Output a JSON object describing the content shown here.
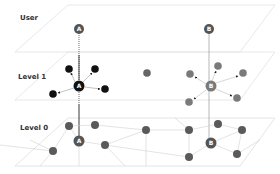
{
  "levels": [
    {
      "id": "user",
      "label": "User"
    },
    {
      "id": "level1",
      "label": "Level 1"
    },
    {
      "id": "level0",
      "label": "Level 0"
    }
  ],
  "nodes": {
    "user_a": {
      "letter": "A",
      "level": "User"
    },
    "user_b": {
      "letter": "B",
      "level": "User"
    },
    "l1_a": {
      "letter": "A",
      "level": "Level 1"
    },
    "l1_b": {
      "letter": "B",
      "level": "Level 1"
    },
    "l0_a": {
      "letter": "A",
      "level": "Level 0"
    },
    "l0_b": {
      "letter": "B",
      "level": "Level 0"
    }
  },
  "colors": {
    "plane_edge": "#d9d9d9",
    "node_gray": "#666666",
    "node_dark": "#111111",
    "user_node": "#555555",
    "b_node": "#7a7a7a",
    "connector": "#333333",
    "mesh_line": "#cccccc"
  }
}
